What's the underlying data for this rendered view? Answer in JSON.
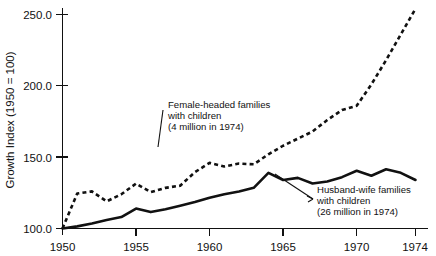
{
  "chart_data": {
    "type": "line",
    "title": "",
    "xlabel": "",
    "ylabel": "Growth Index (1950 = 100)",
    "xlim": [
      1950,
      1974
    ],
    "ylim": [
      95,
      258
    ],
    "grid": false,
    "legend": "annotations-on-plot",
    "xticks": [
      "1950",
      "1955",
      "1960",
      "1965",
      "1970",
      "1974"
    ],
    "xtick_values": [
      1950,
      1955,
      1960,
      1965,
      1970,
      1974
    ],
    "yticks": [
      "100.0",
      "150.0",
      "200.0",
      "250.0"
    ],
    "ytick_values": [
      100.0,
      150.0,
      200.0,
      250.0
    ],
    "x": [
      1950,
      1951,
      1952,
      1953,
      1954,
      1955,
      1956,
      1957,
      1958,
      1959,
      1960,
      1961,
      1962,
      1963,
      1964,
      1965,
      1966,
      1967,
      1968,
      1969,
      1970,
      1971,
      1972,
      1973,
      1974
    ],
    "series": [
      {
        "name": "Female-headed families with children",
        "style": "dashed",
        "values": [
          100.0,
          124.5,
          126.0,
          119.0,
          124.0,
          131.5,
          125.5,
          128.5,
          130.0,
          139.5,
          146.0,
          143.5,
          145.5,
          145.0,
          152.0,
          158.0,
          163.0,
          168.0,
          176.0,
          183.0,
          186.0,
          201.0,
          218.0,
          236.0,
          254.0
        ]
      },
      {
        "name": "Husband-wife families with children",
        "style": "solid",
        "values": [
          100.0,
          101.5,
          103.5,
          106.0,
          108.0,
          114.0,
          111.5,
          113.5,
          116.0,
          118.5,
          121.5,
          124.0,
          126.0,
          128.5,
          139.0,
          134.0,
          135.5,
          131.5,
          133.0,
          136.0,
          140.5,
          137.0,
          141.5,
          139.0,
          134.0
        ]
      }
    ],
    "annotations": [
      {
        "id": "female-headed",
        "lines": [
          "Female-headed families",
          "with children",
          "(4 million in 1974)"
        ],
        "note_million": "4 million in 1974"
      },
      {
        "id": "husband-wife",
        "lines": [
          "Husband-wife families",
          "with children",
          "(26 million in 1974)"
        ],
        "note_million": "26 million in 1974"
      }
    ],
    "colors": {
      "ink": "#111111",
      "background": "#ffffff"
    }
  }
}
